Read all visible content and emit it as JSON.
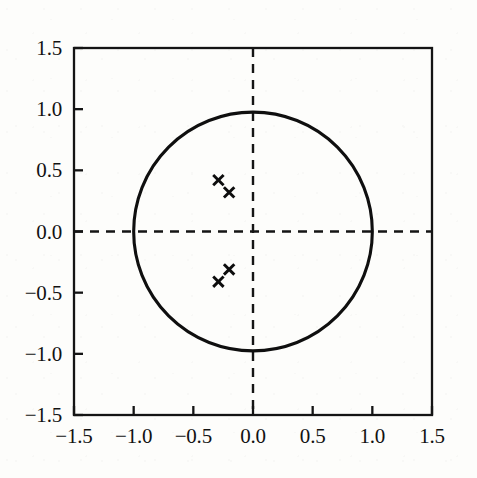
{
  "chart_data": {
    "type": "scatter",
    "title": "",
    "subtitle": "",
    "xlabel": "",
    "ylabel": "",
    "xlim": [
      -1.5,
      1.5
    ],
    "ylim": [
      -1.5,
      1.5
    ],
    "grid": false,
    "legend": null,
    "aspect": "equal",
    "x_ticks": [
      -1.5,
      -1.0,
      -0.5,
      0.0,
      0.5,
      1.0,
      1.5
    ],
    "y_ticks": [
      -1.5,
      -1.0,
      -0.5,
      0.0,
      0.5,
      1.0,
      1.5
    ],
    "x_tick_labels": [
      "−1.5",
      "−1.0",
      "−0.5",
      "0.0",
      "0.5",
      "1.0",
      "1.5"
    ],
    "y_tick_labels": [
      "−1.5",
      "−1.0",
      "−0.5",
      "0.0",
      "0.5",
      "1.0",
      "1.5"
    ],
    "series": [
      {
        "name": "poles",
        "marker": "x",
        "color": "#0d0d0d",
        "points": [
          {
            "x": -0.29,
            "y": 0.42
          },
          {
            "x": -0.2,
            "y": 0.32
          },
          {
            "x": -0.2,
            "y": -0.31
          },
          {
            "x": -0.29,
            "y": -0.41
          }
        ]
      }
    ],
    "annotations": [
      {
        "kind": "circle",
        "name": "unit-circle",
        "center": {
          "x": 0.0,
          "y": 0.0
        },
        "radius": 1.0,
        "style": "solid",
        "color": "#0f0f0f"
      },
      {
        "kind": "hline",
        "name": "real-axis",
        "y": 0.0,
        "style": "dashed",
        "color": "#151515"
      },
      {
        "kind": "vline",
        "name": "imaginary-axis",
        "x": 0.0,
        "style": "dashed",
        "color": "#151515"
      }
    ],
    "colors": {
      "background": "#fdfdfb",
      "axis": "#141414",
      "marker": "#0d0d0d",
      "circle": "#0f0f0f",
      "dashed_axis": "#151515"
    }
  }
}
